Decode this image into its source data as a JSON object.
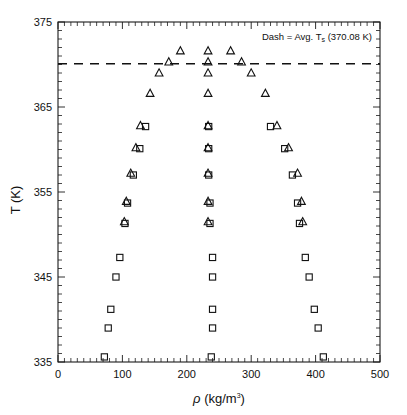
{
  "chart_data": {
    "type": "scatter",
    "title": "",
    "xlabel": "ρ (kg/m³)",
    "xlabel_symbol": "ρ",
    "xlabel_units": "(kg/m",
    "xlabel_exponent": "3",
    "xlabel_close": ")",
    "ylabel": "T (K)",
    "xlim": [
      0,
      500
    ],
    "ylim": [
      335,
      375
    ],
    "xticks": [
      0,
      100,
      200,
      300,
      400,
      500
    ],
    "xticklabels": [
      "0",
      "100",
      "200",
      "300",
      "400",
      "500"
    ],
    "yticks": [
      335,
      345,
      355,
      365,
      375
    ],
    "yticklabels": [
      "335",
      "345",
      "355",
      "365",
      "375"
    ],
    "x_minor_step": 10,
    "y_minor_step": 1,
    "grid": false,
    "legend": "none",
    "annotations": [
      {
        "name": "dash-label",
        "text_full": "Dash = Avg. Tₛ (370.08 K)",
        "text_prefix": "Dash = Avg. T",
        "text_sub": "s",
        "text_suffix": " (370.08 K)",
        "x": 345,
        "y": 373.2
      }
    ],
    "reference_lines": [
      {
        "name": "avg-saturation-temperature",
        "orientation": "horizontal",
        "value": 370.08,
        "style": "dashed",
        "label": "Avg. T_s"
      }
    ],
    "series": [
      {
        "name": "squares",
        "marker": "square",
        "points": [
          [
            72,
            335.6
          ],
          [
            238,
            335.6
          ],
          [
            412,
            335.6
          ],
          [
            78,
            339.0
          ],
          [
            240,
            339.0
          ],
          [
            404,
            339.0
          ],
          [
            82,
            341.2
          ],
          [
            240,
            341.2
          ],
          [
            398,
            341.2
          ],
          [
            90,
            345.0
          ],
          [
            240,
            345.0
          ],
          [
            390,
            345.0
          ],
          [
            96,
            347.3
          ],
          [
            240,
            347.3
          ],
          [
            384,
            347.3
          ],
          [
            104,
            351.3
          ],
          [
            236,
            351.3
          ],
          [
            375,
            351.3
          ],
          [
            108,
            353.7
          ],
          [
            236,
            353.7
          ],
          [
            372,
            353.7
          ],
          [
            117,
            357.0
          ],
          [
            234,
            357.0
          ],
          [
            364,
            357.0
          ],
          [
            127,
            360.1
          ],
          [
            234,
            360.1
          ],
          [
            352,
            360.1
          ],
          [
            136,
            362.7
          ],
          [
            234,
            362.7
          ],
          [
            330,
            362.7
          ]
        ]
      },
      {
        "name": "triangles",
        "marker": "triangle",
        "points": [
          [
            103,
            351.5
          ],
          [
            233,
            351.5
          ],
          [
            380,
            351.5
          ],
          [
            106,
            353.9
          ],
          [
            233,
            353.9
          ],
          [
            378,
            353.9
          ],
          [
            113,
            357.2
          ],
          [
            233,
            357.2
          ],
          [
            372,
            357.2
          ],
          [
            121,
            360.2
          ],
          [
            233,
            360.2
          ],
          [
            358,
            360.2
          ],
          [
            128,
            362.8
          ],
          [
            233,
            362.8
          ],
          [
            340,
            362.8
          ],
          [
            143,
            366.6
          ],
          [
            233,
            366.6
          ],
          [
            322,
            366.6
          ],
          [
            157,
            369.0
          ],
          [
            233,
            369.0
          ],
          [
            300,
            369.0
          ],
          [
            172,
            370.3
          ],
          [
            233,
            370.3
          ],
          [
            285,
            370.3
          ],
          [
            190,
            371.6
          ],
          [
            233,
            371.6
          ],
          [
            268,
            371.6
          ]
        ]
      }
    ]
  },
  "figure": {
    "plot_area": {
      "left": 58,
      "top": 22,
      "right": 380,
      "bottom": 362
    }
  }
}
